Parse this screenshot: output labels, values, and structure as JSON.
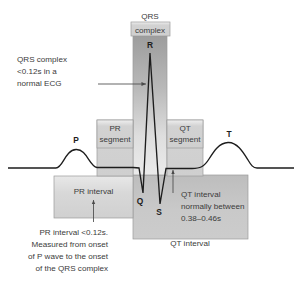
{
  "diagram": {
    "baseline_label": "isoelectric baseline"
  },
  "wave_labels": [
    {
      "id": "p",
      "text": "P"
    },
    {
      "id": "q",
      "text": "Q"
    },
    {
      "id": "r",
      "text": "R"
    },
    {
      "id": "s",
      "text": "S"
    },
    {
      "id": "t",
      "text": "T"
    }
  ],
  "boxes": {
    "qrs_complex": {
      "line1": "QRS",
      "line2": "complex"
    },
    "pr_segment": {
      "line1": "PR",
      "line2": "segment"
    },
    "qt_segment": {
      "line1": "QT",
      "line2": "segment"
    },
    "pr_interval": {
      "label": "PR interval"
    },
    "qt_interval": {
      "label": "QT interval"
    }
  },
  "annotations": {
    "qrs_note": {
      "lines": [
        "QRS complex",
        "<0.12s in a",
        "normal ECG"
      ]
    },
    "pr_note": {
      "lines": [
        "PR interval <0.12s.",
        "Measured from onset",
        "of P wave to the onset",
        "of the QRS complex"
      ]
    },
    "qt_note": {
      "lines": [
        "QT interval",
        "normally between",
        "0.38–0.46s"
      ]
    }
  },
  "colors": {
    "trace": "#1d1d1d",
    "text": "#3b3b3b",
    "box_border": "#9a9a9a",
    "band_dark": "#9e9e9e",
    "band_light": "#e4e4e4",
    "background": "#ffffff"
  }
}
